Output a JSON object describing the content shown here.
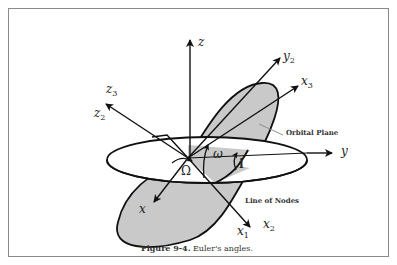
{
  "figure": {
    "caption_number": "Figure 9-4.",
    "caption_text": "Euler's angles."
  },
  "axes_labels": {
    "z": "z",
    "y2": "y",
    "y2_sub": "2",
    "x3": "x",
    "x3_sub": "3",
    "z3": "z",
    "z3_sub": "3",
    "z2": "z",
    "z2_sub": "2",
    "y": "y",
    "x": "x",
    "x1": "x",
    "x1_sub": "1",
    "x2": "x",
    "x2_sub": "2"
  },
  "angles": {
    "omega_lower": "ω",
    "Omega_upper": "Ω",
    "inclination": "i"
  },
  "annotations": {
    "orbital_plane": "Orbital Plane",
    "line_of_nodes": "Line of Nodes"
  },
  "colors": {
    "plane_fill": "#c9c9c9",
    "line": "#111111",
    "frame": "#8a8a8a"
  }
}
